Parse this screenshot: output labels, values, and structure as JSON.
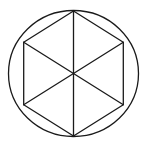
{
  "diagram": {
    "shapes": {
      "circle": {
        "kind": "circumscribed-circle"
      },
      "hexagon": {
        "kind": "regular-hexagon",
        "sides": 6,
        "orientation": "vertex-up"
      },
      "diagonals": {
        "count": 3,
        "through": "center"
      }
    },
    "colors": {
      "stroke": "#1a1a1a",
      "background": "#ffffff"
    }
  }
}
